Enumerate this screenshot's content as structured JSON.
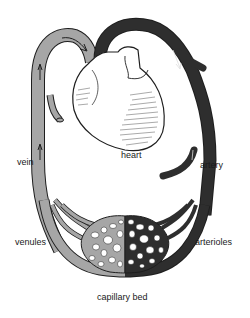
{
  "diagram": {
    "colors": {
      "background": "#ffffff",
      "vein_fill": "#a6a6a6",
      "artery_fill": "#2e2e2e",
      "outline": "#1e1e1e",
      "heart_fill": "#ffffff"
    },
    "labels": {
      "heart": "heart",
      "vein": "vein",
      "artery": "artery",
      "venules": "venules",
      "arterioles": "arterioles",
      "capillary_bed": "capillary bed"
    },
    "components": [
      {
        "id": "heart",
        "label": "heart",
        "type": "organ"
      },
      {
        "id": "vein",
        "label": "vein",
        "type": "vessel",
        "flow": "toward heart"
      },
      {
        "id": "artery",
        "label": "artery",
        "type": "vessel",
        "flow": "away from heart"
      },
      {
        "id": "venules",
        "label": "venules",
        "type": "small vessels"
      },
      {
        "id": "arterioles",
        "label": "arterioles",
        "type": "small vessels"
      },
      {
        "id": "capillary_bed",
        "label": "capillary bed",
        "type": "network"
      }
    ],
    "connections": [
      {
        "from": "heart",
        "to": "artery"
      },
      {
        "from": "artery",
        "to": "arterioles"
      },
      {
        "from": "arterioles",
        "to": "capillary_bed"
      },
      {
        "from": "capillary_bed",
        "to": "venules"
      },
      {
        "from": "venules",
        "to": "vein"
      },
      {
        "from": "vein",
        "to": "heart"
      }
    ]
  }
}
